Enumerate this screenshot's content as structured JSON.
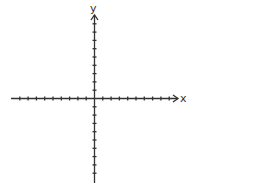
{
  "diagram": {
    "type": "coordinate-plane",
    "x_axis": {
      "label": "x",
      "ticks_negative": 9,
      "ticks_positive": 9,
      "arrow_direction": "right"
    },
    "y_axis": {
      "label": "y",
      "ticks_positive": 9,
      "ticks_negative": 9,
      "arrow_direction": "up"
    },
    "colors": {
      "axis": "#333333",
      "background": "#ffffff"
    }
  }
}
